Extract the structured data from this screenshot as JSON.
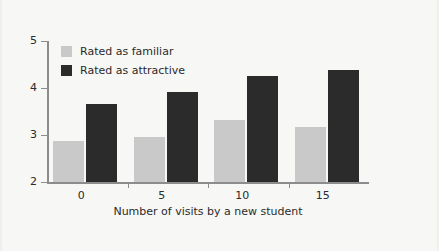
{
  "chart_data": {
    "type": "bar",
    "title": "",
    "xlabel": "Number of visits by a new student",
    "ylabel": "",
    "categories": [
      "0",
      "5",
      "10",
      "15"
    ],
    "x": [
      0,
      5,
      10,
      15
    ],
    "series": [
      {
        "name": "Rated as familiar",
        "color": "#c9c9c9",
        "values": [
          2.88,
          2.96,
          3.33,
          3.16
        ]
      },
      {
        "name": "Rated as attractive",
        "color": "#2b2b2b",
        "values": [
          3.67,
          3.91,
          4.25,
          4.38
        ]
      }
    ],
    "ylim": [
      2,
      5
    ],
    "yticks": [
      "2",
      "3",
      "4",
      "5"
    ],
    "ytick_values": [
      2,
      3,
      4,
      5
    ],
    "xticks": [
      "0",
      "5",
      "10",
      "15"
    ],
    "grid": false,
    "legend_position": "upper-left"
  },
  "legend": {
    "items": [
      {
        "label": "Rated as familiar",
        "swatch": "familiar"
      },
      {
        "label": "Rated as attractive",
        "swatch": "attractive"
      }
    ]
  },
  "axes": {
    "y": {
      "ticks": [
        "2",
        "3",
        "4",
        "5"
      ]
    },
    "x": {
      "ticks": [
        "0",
        "5",
        "10",
        "15"
      ],
      "title": "Number of visits by a new student"
    }
  },
  "colors": {
    "background": "#f7f7f5",
    "familiar": "#c9c9c9",
    "attractive": "#2b2b2b",
    "axis": "#8c8c8c",
    "text": "#2b2b2b"
  }
}
